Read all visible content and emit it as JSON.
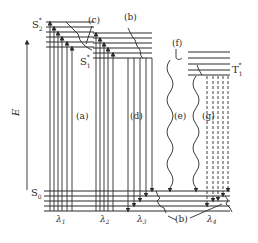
{
  "diagram": {
    "type": "jablonski",
    "axis_label": "E",
    "states": {
      "s2": {
        "label": "S",
        "sub": "2",
        "sup": "*"
      },
      "s1": {
        "label": "S",
        "sub": "1",
        "sup": "*"
      },
      "t1": {
        "label": "T",
        "sub": "1",
        "sup": "*"
      },
      "s0": {
        "label": "S",
        "sub": "0"
      }
    },
    "process_labels": {
      "a": "(a)",
      "b_top": "(b)",
      "b_bottom": "(b)",
      "c": "(c)",
      "d": "(d)",
      "e": "(e)",
      "f": "(f)",
      "g": "(g)"
    },
    "wavelengths": {
      "l1": {
        "symbol": "λ",
        "sub": "1"
      },
      "l2": {
        "symbol": "λ",
        "sub": "2"
      },
      "l3": {
        "symbol": "λ",
        "sub": "3"
      },
      "l4": {
        "symbol": "λ",
        "sub": "4"
      }
    },
    "colors": {
      "ink": "#2a2a2a",
      "background": "#ffffff"
    }
  }
}
